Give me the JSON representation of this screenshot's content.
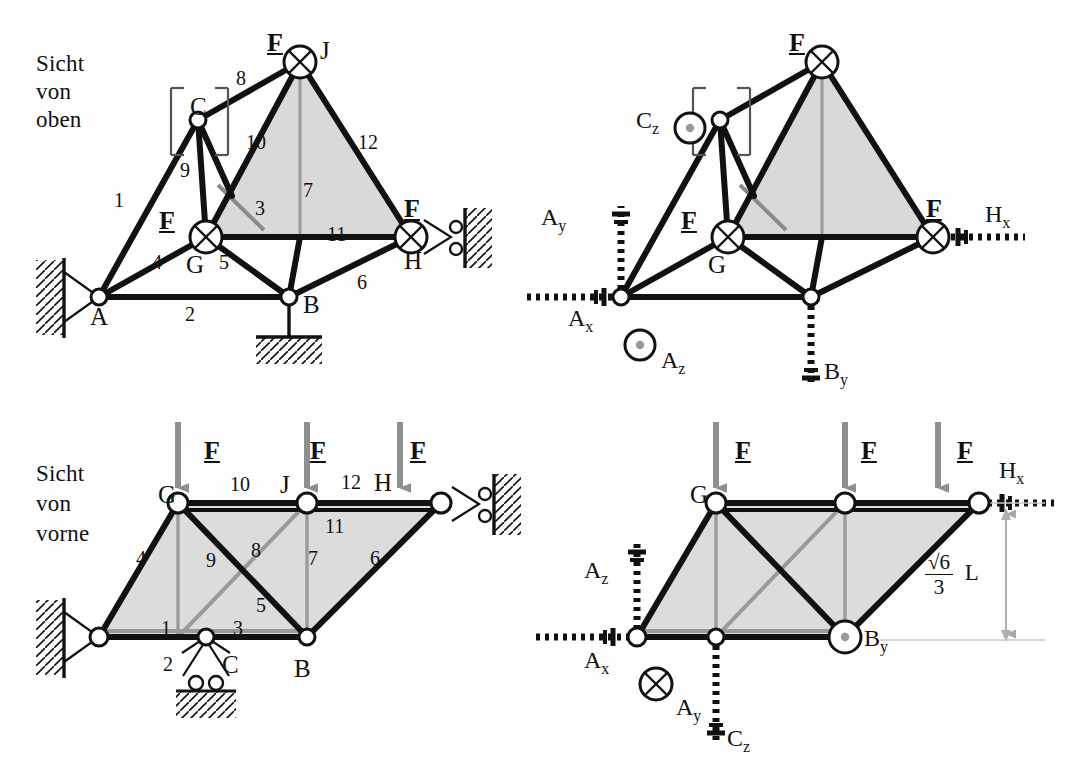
{
  "figure": {
    "type": "engineering-statics-space-truss",
    "background_color": "#fefefe",
    "ink_color": "#111111",
    "fill_color": "#d8d8d8",
    "accent_gray": "#8f8f8f"
  },
  "panels": [
    {
      "id": "top-left",
      "title_line1": "Sicht",
      "title_line2": "von",
      "title_line3": "oben",
      "node_labels": [
        "A",
        "B",
        "C",
        "G",
        "H",
        "J"
      ],
      "member_labels": [
        "1",
        "2",
        "3",
        "4",
        "5",
        "6",
        "7",
        "8",
        "9",
        "10",
        "11",
        "12"
      ],
      "force_labels": [
        "F",
        "F",
        "F"
      ],
      "supports": [
        "pinned-A",
        "rod-B",
        "roller-H"
      ]
    },
    {
      "id": "top-right",
      "node_labels": [
        "G"
      ],
      "force_labels": [
        "F",
        "F",
        "F"
      ],
      "reactions": [
        {
          "label": "A",
          "sub": "x"
        },
        {
          "label": "A",
          "sub": "y"
        },
        {
          "label": "A",
          "sub": "z"
        },
        {
          "label": "B",
          "sub": "y"
        },
        {
          "label": "C",
          "sub": "z"
        },
        {
          "label": "H",
          "sub": "x"
        }
      ]
    },
    {
      "id": "bottom-left",
      "title_line1": "Sicht",
      "title_line2": "von",
      "title_line3": "vorne",
      "node_labels": [
        "B",
        "C",
        "G",
        "H",
        "J"
      ],
      "member_labels": [
        "1",
        "2",
        "3",
        "4",
        "5",
        "6",
        "7",
        "8",
        "9",
        "10",
        "11",
        "12"
      ],
      "force_labels": [
        "F",
        "F",
        "F"
      ],
      "supports": [
        "pinned-A",
        "roller-C",
        "roller-H"
      ]
    },
    {
      "id": "bottom-right",
      "node_labels": [
        "G"
      ],
      "force_labels": [
        "F",
        "F",
        "F"
      ],
      "reactions": [
        {
          "label": "A",
          "sub": "x"
        },
        {
          "label": "A",
          "sub": "y"
        },
        {
          "label": "A",
          "sub": "z"
        },
        {
          "label": "B",
          "sub": "y"
        },
        {
          "label": "C",
          "sub": "z"
        },
        {
          "label": "H",
          "sub": "x"
        }
      ],
      "dimension": {
        "numerator": "6",
        "radical": "√",
        "denominator": "3",
        "unit": "L"
      }
    }
  ],
  "text": {
    "sicht": "Sicht",
    "von": "von",
    "oben": "oben",
    "vorne": "vorne",
    "F": "F",
    "A": "A",
    "B": "B",
    "C": "C",
    "G": "G",
    "H": "H",
    "J": "J",
    "L": "L",
    "three": "3",
    "six": "6",
    "m1": "1",
    "m2": "2",
    "m3": "3",
    "m4": "4",
    "m5": "5",
    "m6": "6",
    "m7": "7",
    "m8": "8",
    "m9": "9",
    "m10": "10",
    "m11": "11",
    "m12": "12"
  },
  "reaction_text": {
    "Ax": "A",
    "Ax_sub": "x",
    "Ay": "A",
    "Ay_sub": "y",
    "Az": "A",
    "Az_sub": "z",
    "By": "B",
    "By_sub": "y",
    "Cz": "C",
    "Cz_sub": "z",
    "Hx": "H",
    "Hx_sub": "x"
  }
}
